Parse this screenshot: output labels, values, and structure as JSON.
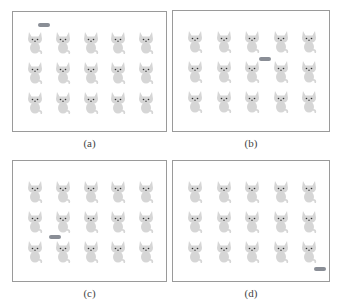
{
  "figure": {
    "panels": [
      {
        "id": "a",
        "caption": "(a)",
        "x": 12,
        "y": 11,
        "w": 155,
        "h": 121,
        "fish": {
          "x": 37,
          "y": 22
        }
      },
      {
        "id": "b",
        "caption": "(b)",
        "x": 172,
        "y": 10,
        "w": 158,
        "h": 122,
        "fish": {
          "x": 258,
          "y": 56
        }
      },
      {
        "id": "c",
        "caption": "(c)",
        "x": 12,
        "y": 160,
        "w": 155,
        "h": 122,
        "fish": {
          "x": 48,
          "y": 234
        }
      },
      {
        "id": "d",
        "caption": "(d)",
        "x": 172,
        "y": 160,
        "w": 158,
        "h": 122,
        "fish": {
          "x": 313,
          "y": 266
        }
      }
    ],
    "grid": {
      "columns": 5,
      "rows": 3
    },
    "colors": {
      "cat": "#d6d6d6",
      "cat_features": "#333333",
      "fish": "#8a8e96",
      "border": "#9a9a9a"
    },
    "icons": {
      "cat": "cat-icon",
      "fish": "fish-icon"
    }
  }
}
